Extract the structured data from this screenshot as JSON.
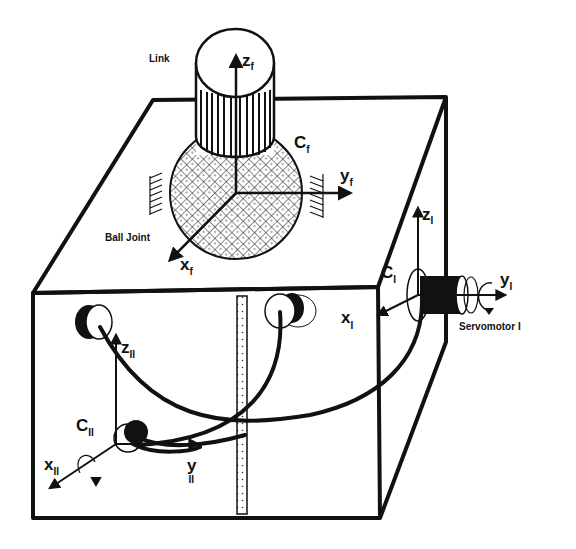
{
  "diagram": {
    "labels": {
      "link": "Link",
      "ball_joint": "Ball Joint",
      "servomotor": "Servomotor I"
    },
    "frames": {
      "f": {
        "origin": "C",
        "origin_sub": "f",
        "x": "x",
        "y": "y",
        "z": "z",
        "sub": "f"
      },
      "I": {
        "origin": "C",
        "origin_sub": "I",
        "x": "x",
        "y": "y",
        "z": "z",
        "sub": "I"
      },
      "II": {
        "origin": "C",
        "origin_sub": "II",
        "x": "x",
        "y": "y",
        "z": "z",
        "sub": "II"
      }
    },
    "components": [
      "cylindrical-link",
      "ball-joint",
      "servomotor-I",
      "pulley-II",
      "cable",
      "box-enclosure",
      "dotted-rail"
    ],
    "colors": {
      "ink": "#111111",
      "paper": "#ffffff"
    }
  }
}
